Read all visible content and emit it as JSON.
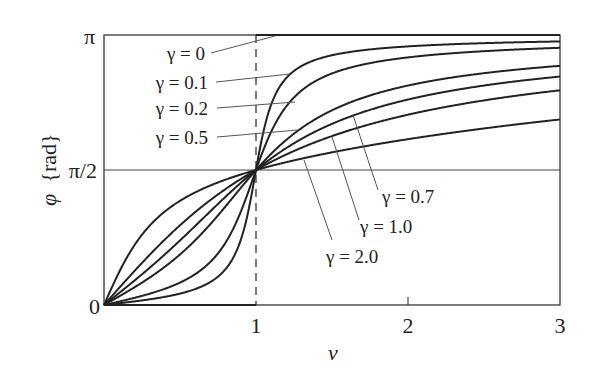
{
  "chart_data": {
    "type": "line",
    "title": "",
    "xlabel": "ν",
    "ylabel": "φ{rad}",
    "xlim": [
      0,
      3
    ],
    "ylim": [
      0,
      3.14159
    ],
    "x_ticks": [
      {
        "value": 1,
        "label": "1"
      },
      {
        "value": 2,
        "label": "2"
      },
      {
        "value": 3,
        "label": "3"
      }
    ],
    "y_ticks": [
      {
        "value": 0,
        "label": "0"
      },
      {
        "value": 1.5708,
        "label": "π/2"
      },
      {
        "value": 3.14159,
        "label": "π"
      }
    ],
    "grid": false,
    "reference_lines": [
      {
        "orientation": "vertical",
        "value": 1,
        "style": "dashed"
      },
      {
        "orientation": "horizontal",
        "value": 1.5708,
        "style": "solid"
      }
    ],
    "formula": "φ = atan2(2γν, 1 − ν²)",
    "series": [
      {
        "name": "γ = 0",
        "gamma": 0,
        "values_at": {
          "0": 0,
          "1": 1.5708,
          "2": 3.1416,
          "3": 3.1416
        }
      },
      {
        "name": "γ = 0.1",
        "gamma": 0.1,
        "values_at": {
          "0": 0,
          "0.5": 0.133,
          "1": 1.5708,
          "2": 3.008,
          "3": 3.067
        }
      },
      {
        "name": "γ = 0.2",
        "gamma": 0.2,
        "values_at": {
          "0": 0,
          "0.5": 0.261,
          "1": 1.5708,
          "2": 2.88,
          "3": 2.993
        }
      },
      {
        "name": "γ = 0.5",
        "gamma": 0.5,
        "values_at": {
          "0": 0,
          "0.5": 0.588,
          "1": 1.5708,
          "2": 2.554,
          "3": 2.783
        }
      },
      {
        "name": "γ = 0.7",
        "gamma": 0.7,
        "values_at": {
          "0": 0,
          "0.5": 0.752,
          "1": 1.5708,
          "2": 2.39,
          "3": 2.658
        }
      },
      {
        "name": "γ = 1.0",
        "gamma": 1.0,
        "values_at": {
          "0": 0,
          "0.5": 0.927,
          "1": 1.5708,
          "2": 2.214,
          "3": 2.498
        }
      },
      {
        "name": "γ = 2.0",
        "gamma": 2.0,
        "values_at": {
          "0": 0,
          "0.5": 1.212,
          "1": 1.5708,
          "2": 1.929,
          "3": 2.159
        }
      }
    ],
    "annotations": [
      {
        "text": "γ = 0",
        "position": "upper-left"
      },
      {
        "text": "γ = 0.1",
        "position": "upper-left"
      },
      {
        "text": "γ = 0.2",
        "position": "upper-left"
      },
      {
        "text": "γ = 0.5",
        "position": "upper-left"
      },
      {
        "text": "γ = 0.7",
        "position": "lower-right"
      },
      {
        "text": "γ = 1.0",
        "position": "lower-right"
      },
      {
        "text": "γ = 2.0",
        "position": "lower-right"
      }
    ]
  },
  "labels": {
    "xlabel": "ν",
    "ylabel_phi": "φ",
    "ylabel_unit": "{rad}",
    "ytick_0": "0",
    "ytick_half": "π/2",
    "ytick_pi": "π",
    "xtick_1": "1",
    "xtick_2": "2",
    "xtick_3": "3",
    "g0": "γ = 0",
    "g01": "γ = 0.1",
    "g02": "γ = 0.2",
    "g05": "γ = 0.5",
    "g07": "γ = 0.7",
    "g10": "γ = 1.0",
    "g20": "γ = 2.0"
  },
  "style": {
    "line_color": "#222222",
    "axis_color": "#444444",
    "leader_color": "#555555"
  }
}
